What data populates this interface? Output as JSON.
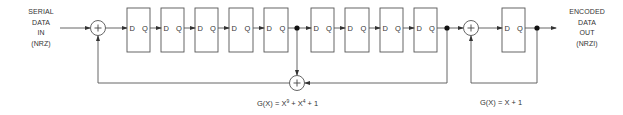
{
  "diagram": {
    "input_label": [
      "SERIAL",
      "DATA",
      "IN",
      "(NRZ)"
    ],
    "output_label": [
      "ENCODED",
      "DATA",
      "OUT",
      "(NRZI)"
    ],
    "flipflop_pin_d": "D",
    "flipflop_pin_q": "Q",
    "scrambler_flipflop_count": 9,
    "encoder_flipflop_count": 1,
    "xor_symbol": "+",
    "equations": {
      "scrambler": {
        "prefix": "G(X) = X",
        "exp1": "9",
        "mid": " + X",
        "exp2": "4",
        "suffix": " + 1"
      },
      "encoder": {
        "text": "G(X) = X + 1"
      }
    },
    "colors": {
      "line": "#444444",
      "text": "#333333",
      "background": "#ffffff"
    }
  }
}
